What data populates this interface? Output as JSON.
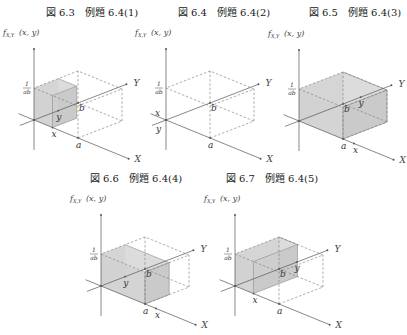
{
  "figures": [
    {
      "id": "fig-6-3",
      "caption": "図 6.3　例題 6.4(1)",
      "caption_pos": [
        92,
        16
      ],
      "origin": [
        34,
        120
      ],
      "shade": "xy",
      "x_frac": 0.42,
      "y_frac": 0.55,
      "var_labels": "near"
    },
    {
      "id": "fig-6-4",
      "caption": "図 6.4　例題 6.4(2)",
      "caption_pos": [
        224,
        16
      ],
      "origin": [
        166,
        120
      ],
      "shade": "none",
      "x_frac": -0.25,
      "y_frac": -0.25,
      "var_labels": "negative"
    },
    {
      "id": "fig-6-5",
      "caption": "図 6.5　例題 6.4(3)",
      "caption_pos": [
        355,
        16
      ],
      "origin": [
        299,
        121
      ],
      "shade": "full",
      "x_frac": 1.25,
      "y_frac": 1.4,
      "var_labels": "beyond"
    },
    {
      "id": "fig-6-6",
      "caption": "図 6.6　例題 6.4(4)",
      "caption_pos": [
        136,
        182
      ],
      "origin": [
        101,
        286
      ],
      "shade": "a_by_y",
      "x_frac": 1.25,
      "y_frac": 0.55,
      "var_labels": "x_beyond"
    },
    {
      "id": "fig-6-7",
      "caption": "図 6.7　例題 6.4(5)",
      "caption_pos": [
        272,
        182
      ],
      "origin": [
        235,
        286
      ],
      "shade": "x_by_b",
      "x_frac": 0.42,
      "y_frac": 1.4,
      "var_labels": "y_beyond"
    }
  ],
  "labels": {
    "vertical_axis": "f",
    "vertical_axis_sub": "X,Y",
    "vertical_axis_args": "(x, y)",
    "x_axis": "X",
    "y_axis": "Y",
    "a": "a",
    "b": "b",
    "x": "x",
    "y": "y",
    "height_num": "1",
    "height_den": "ab"
  },
  "geometry": {
    "vec_a": [
      44,
      18
    ],
    "vec_b": [
      44,
      -17
    ],
    "height": 32,
    "x_axis_ext": [
      2.15,
      -0.35
    ],
    "y_axis_ext": [
      2.1,
      -0.32
    ],
    "vert_up": 71,
    "vert_down": 30
  },
  "colors": {
    "axis": "#555555",
    "dash": "#777777",
    "shade": "#d4d4d4",
    "shade_edge": "#888888"
  }
}
